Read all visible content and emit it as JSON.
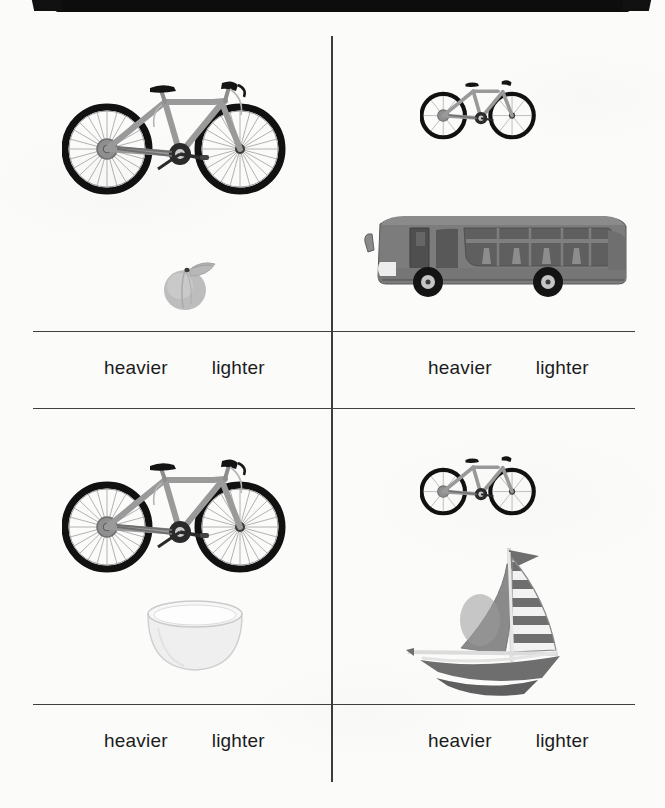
{
  "worksheet": {
    "background_color": "#fbfbfa",
    "line_color": "#3f3f3f",
    "scan_bar_color": "#0d0d0d"
  },
  "answer_labels": {
    "heavier": "heavier",
    "lighter": "lighter"
  },
  "cells": [
    {
      "id": "top-left",
      "items": [
        {
          "name": "bicycle",
          "size": "large"
        },
        {
          "name": "peach",
          "size": "small"
        }
      ],
      "options": [
        "heavier",
        "lighter"
      ]
    },
    {
      "id": "top-right",
      "items": [
        {
          "name": "bicycle",
          "size": "small"
        },
        {
          "name": "bus",
          "size": "large"
        }
      ],
      "options": [
        "heavier",
        "lighter"
      ]
    },
    {
      "id": "bottom-left",
      "items": [
        {
          "name": "bicycle",
          "size": "large"
        },
        {
          "name": "bowl",
          "size": "medium"
        }
      ],
      "options": [
        "heavier",
        "lighter"
      ]
    },
    {
      "id": "bottom-right",
      "items": [
        {
          "name": "bicycle",
          "size": "small"
        },
        {
          "name": "sailboat",
          "size": "medium"
        }
      ],
      "options": [
        "heavier",
        "lighter"
      ]
    }
  ],
  "colors": {
    "bike_frame": "#9a9a9a",
    "bike_tire": "#111111",
    "bus_body": "#7c7c7c",
    "bus_window": "#5f5f5f",
    "peach_body": "#bdbdbd",
    "bowl_body": "#efefef",
    "boat_sail": "#8a8a8a",
    "boat_hull": "#6e6e6e"
  }
}
